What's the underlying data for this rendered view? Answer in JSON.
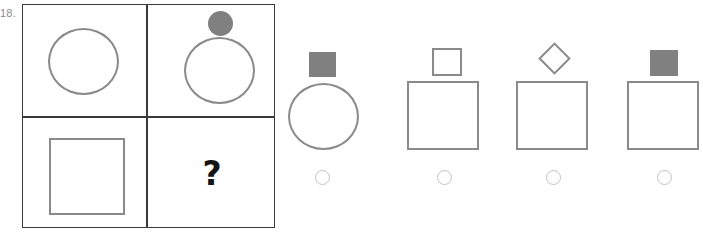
{
  "item": {
    "number_label": "18.",
    "type": "visual-analogy-matrix",
    "missing_cell_marker": "?"
  },
  "colors": {
    "matrix_border": "#3a3a3a",
    "shape_stroke": "#8a8a8a",
    "shape_fill": "#808080",
    "radio_stroke": "#c2c2c2",
    "question_mark": "#141414",
    "item_number": "#8c8c8c",
    "background": "#ffffff"
  },
  "matrix": {
    "rows": 2,
    "columns": 2,
    "cells": [
      {
        "position": "row1-col1",
        "name": "matrix-cell-top-left",
        "shapes": [
          {
            "shape": "circle",
            "fill": "none",
            "stroke": "#8a8a8a",
            "size": "large",
            "role": "base"
          }
        ]
      },
      {
        "position": "row1-col2",
        "name": "matrix-cell-top-right",
        "shapes": [
          {
            "shape": "circle",
            "fill": "#808080",
            "stroke": "none",
            "size": "small",
            "role": "topper"
          },
          {
            "shape": "circle",
            "fill": "none",
            "stroke": "#8a8a8a",
            "size": "large",
            "role": "base"
          }
        ]
      },
      {
        "position": "row2-col1",
        "name": "matrix-cell-bottom-left",
        "shapes": [
          {
            "shape": "square",
            "fill": "none",
            "stroke": "#8a8a8a",
            "size": "large",
            "role": "base"
          }
        ]
      },
      {
        "position": "row2-col2",
        "name": "matrix-cell-bottom-right",
        "shapes": [],
        "marker": "?"
      }
    ]
  },
  "options": [
    {
      "id": "A",
      "name": "answer-option-a",
      "selected": false,
      "shapes": [
        {
          "shape": "square",
          "fill": "#808080",
          "stroke": "none",
          "size": "small",
          "role": "topper"
        },
        {
          "shape": "circle",
          "fill": "none",
          "stroke": "#8a8a8a",
          "size": "large",
          "role": "base"
        }
      ]
    },
    {
      "id": "B",
      "name": "answer-option-b",
      "selected": false,
      "shapes": [
        {
          "shape": "square",
          "fill": "none",
          "stroke": "#8a8a8a",
          "size": "small",
          "role": "topper"
        },
        {
          "shape": "square",
          "fill": "none",
          "stroke": "#8a8a8a",
          "size": "large",
          "role": "base"
        }
      ]
    },
    {
      "id": "C",
      "name": "answer-option-c",
      "selected": false,
      "shapes": [
        {
          "shape": "diamond",
          "fill": "none",
          "stroke": "#8a8a8a",
          "size": "small",
          "role": "topper"
        },
        {
          "shape": "square",
          "fill": "none",
          "stroke": "#8a8a8a",
          "size": "large",
          "role": "base"
        }
      ]
    },
    {
      "id": "D",
      "name": "answer-option-d",
      "selected": false,
      "shapes": [
        {
          "shape": "square",
          "fill": "#808080",
          "stroke": "none",
          "size": "small",
          "role": "topper"
        },
        {
          "shape": "square",
          "fill": "none",
          "stroke": "#8a8a8a",
          "size": "large",
          "role": "base"
        }
      ]
    }
  ]
}
